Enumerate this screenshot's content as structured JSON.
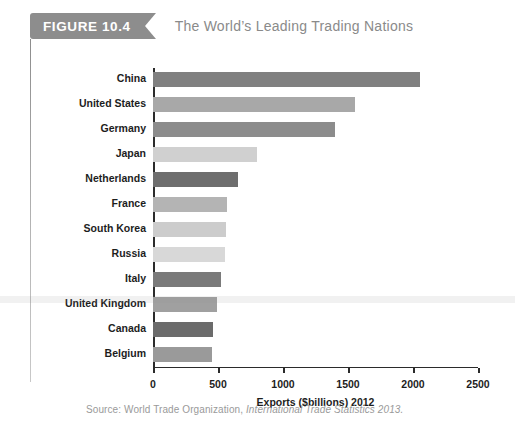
{
  "figure": {
    "badge": "FIGURE 10.4",
    "title": "The World’s Leading Trading Nations"
  },
  "source": {
    "prefix": "Source: World Trade Organization, ",
    "italic": "International Trade Statistics 2013."
  },
  "colors": {
    "badge_bg": "#8d8d8d",
    "title_text": "#8a8a8a",
    "axis": "#2b2b2b",
    "source_text": "#9a9a9a"
  },
  "chart_data": {
    "type": "bar",
    "orientation": "horizontal",
    "title": "The World’s Leading Trading Nations",
    "xlabel": "Exports ($billions) 2012",
    "ylabel": "",
    "xlim": [
      0,
      2500
    ],
    "grid": false,
    "legend": "none",
    "xticks": [
      0,
      500,
      1000,
      1500,
      2000,
      2500
    ],
    "xtick_labels": [
      "0",
      "500",
      "1000",
      "1500",
      "2000",
      "2500"
    ],
    "categories": [
      "China",
      "United States",
      "Germany",
      "Japan",
      "Netherlands",
      "France",
      "South Korea",
      "Russia",
      "Italy",
      "United Kingdom",
      "Canada",
      "Belgium"
    ],
    "values": [
      2050,
      1550,
      1400,
      800,
      655,
      570,
      565,
      550,
      520,
      490,
      465,
      450
    ],
    "bar_colors": [
      "#808080",
      "#a8a8a8",
      "#8c8c8c",
      "#d0d0d0",
      "#6e6e6e",
      "#b4b4b4",
      "#cccccc",
      "#d8d8d8",
      "#7a7a7a",
      "#a0a0a0",
      "#6b6b6b",
      "#9a9a9a"
    ]
  }
}
